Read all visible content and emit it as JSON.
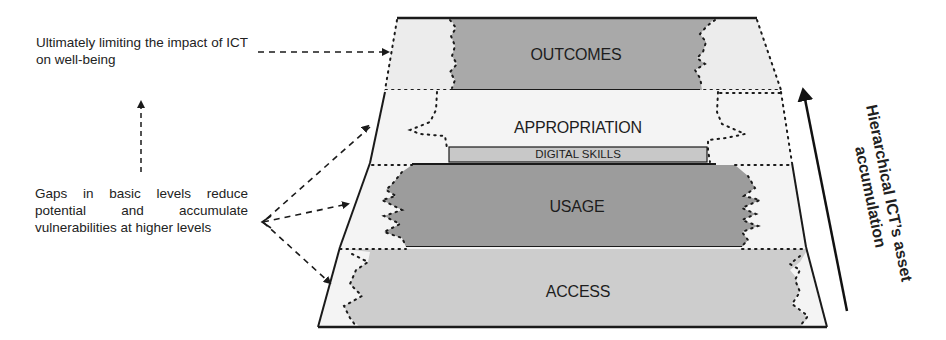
{
  "diagram": {
    "type": "layered-pyramid",
    "layers": [
      {
        "label": "OUTCOMES",
        "order": 4,
        "fill": "#a9a9a9"
      },
      {
        "label": "APPROPRIATION",
        "order": 3,
        "fill": "#f1f1f1"
      },
      {
        "label": "USAGE",
        "order": 2,
        "fill": "#9c9c9c"
      },
      {
        "label": "ACCESS",
        "order": 1,
        "fill": "#cdcdcd"
      }
    ],
    "sub_box": {
      "label": "DIGITAL SKILLS",
      "fill": "#c8c8c8",
      "within_layer": "APPROPRIATION"
    },
    "annotations": {
      "top_note": "Ultimately limiting the impact of ICT on well-being",
      "bottom_note": "Gaps in basic levels reduce potential and accumulate vulnerabilities at higher levels"
    },
    "axis_arrow": {
      "label_line1": "Hierarchical ICT’s asset",
      "label_line2": "accumulation",
      "direction": "up"
    },
    "colors": {
      "outline": "#1a1a1a",
      "gap_fill": "#ececec",
      "text": "#1d1d1d"
    }
  }
}
